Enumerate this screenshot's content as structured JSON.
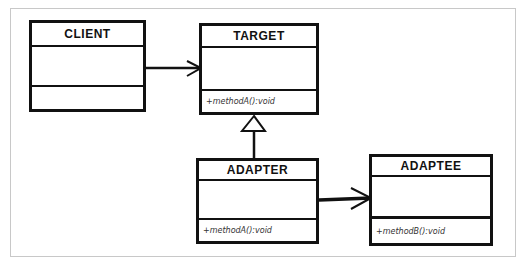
{
  "diagram": {
    "type": "UML class diagram",
    "classes": [
      {
        "id": "client",
        "name": "CLIENT",
        "attributes": [],
        "operations": []
      },
      {
        "id": "target",
        "name": "TARGET",
        "attributes": [],
        "operations": [
          "+methodA():void"
        ]
      },
      {
        "id": "adapter",
        "name": "ADAPTER",
        "attributes": [],
        "operations": [
          "+methodA():void"
        ]
      },
      {
        "id": "adaptee",
        "name": "ADAPTEE",
        "attributes": [],
        "operations": [
          "+methodB():void"
        ]
      }
    ],
    "relationships": [
      {
        "from": "CLIENT",
        "to": "TARGET",
        "kind": "association",
        "arrow": "open"
      },
      {
        "from": "ADAPTER",
        "to": "TARGET",
        "kind": "generalization",
        "arrow": "hollow-triangle"
      },
      {
        "from": "ADAPTER",
        "to": "ADAPTEE",
        "kind": "association",
        "arrow": "open"
      }
    ],
    "colors": {
      "stroke": "#111111",
      "background": "#ffffff",
      "frame": "#c8c8c8"
    }
  }
}
